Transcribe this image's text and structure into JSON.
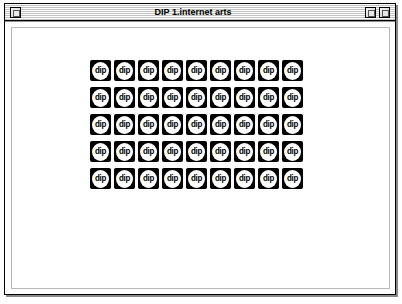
{
  "window": {
    "title": "DIP 1.internet arts",
    "close_box_name": "close-box",
    "zoom_box_name": "zoom-box",
    "collapse_box_name": "collapse-box"
  },
  "canvas": {
    "background_color": "#ffffff",
    "icon_color": "#000000",
    "icon_badge_color": "#ffffff"
  },
  "icon_grid": {
    "columns": 9,
    "rows": 5,
    "total": 45,
    "icon_label": "dip",
    "icons": [
      "dip",
      "dip",
      "dip",
      "dip",
      "dip",
      "dip",
      "dip",
      "dip",
      "dip",
      "dip",
      "dip",
      "dip",
      "dip",
      "dip",
      "dip",
      "dip",
      "dip",
      "dip",
      "dip",
      "dip",
      "dip",
      "dip",
      "dip",
      "dip",
      "dip",
      "dip",
      "dip",
      "dip",
      "dip",
      "dip",
      "dip",
      "dip",
      "dip",
      "dip",
      "dip",
      "dip",
      "dip",
      "dip",
      "dip",
      "dip",
      "dip",
      "dip",
      "dip",
      "dip",
      "dip"
    ]
  }
}
